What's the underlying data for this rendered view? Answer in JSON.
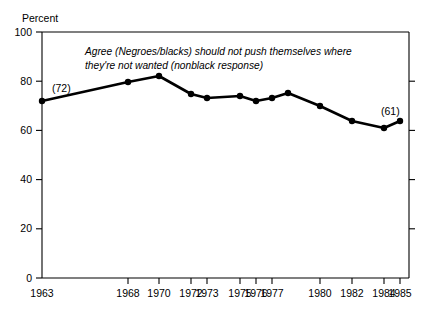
{
  "chart_data": {
    "type": "line",
    "title": "",
    "subtitle": "",
    "annotation": [
      "Agree (Negroes/blacks) should not push themselves where",
      "they're not wanted (nonblack response)"
    ],
    "ylabel": "Percent",
    "xlabel": "",
    "ylim": [
      0,
      100
    ],
    "yticks": [
      "0",
      "20",
      "40",
      "60",
      "80",
      "100"
    ],
    "ytick_values": [
      0,
      20,
      40,
      60,
      80,
      100
    ],
    "grid": false,
    "legend": "none",
    "xtick_labels": [
      "1963",
      "1968",
      "1970",
      "1972",
      "1973",
      "1975",
      "1976",
      "1977",
      "1980",
      "1982",
      "1984",
      "1985"
    ],
    "xtick_positions": [
      42,
      128,
      159,
      191,
      207,
      240,
      256,
      272,
      320,
      352,
      384,
      400
    ],
    "x": [
      1963,
      1968,
      1970,
      1972,
      1973,
      1975,
      1976,
      1977,
      1978,
      1980,
      1982,
      1984,
      1985
    ],
    "values": [
      72,
      78,
      82,
      75,
      73,
      74,
      72,
      73,
      71,
      68,
      62,
      59,
      61
    ],
    "point_px": [
      [
        42,
        101
      ],
      [
        128,
        82
      ],
      [
        159,
        76
      ],
      [
        191,
        94
      ],
      [
        207,
        98
      ],
      [
        240,
        96
      ],
      [
        256,
        101
      ],
      [
        272,
        98
      ],
      [
        288,
        93
      ],
      [
        320,
        106
      ],
      [
        352,
        121
      ],
      [
        384,
        128
      ],
      [
        400,
        121
      ]
    ],
    "point_labels": [
      {
        "index": 0,
        "text": "(72)",
        "x": 52,
        "y": 92
      },
      {
        "index": 12,
        "text": "(61)",
        "x": 381,
        "y": 115
      }
    ],
    "colors": {
      "line": "#000000",
      "marker": "#000000",
      "axis": "#000000",
      "background": "#ffffff"
    }
  }
}
